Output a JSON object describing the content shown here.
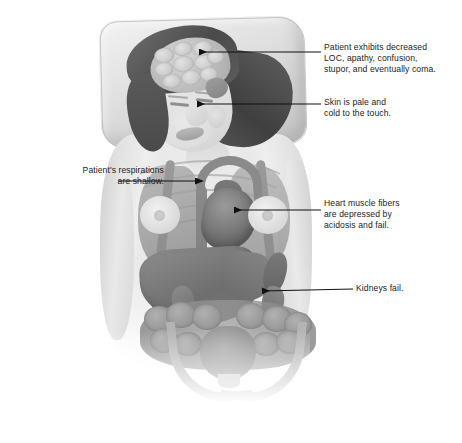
{
  "figure": {
    "palette": {
      "background": "#ffffff",
      "skin": "#e4e4e4",
      "pillow": "#dedede",
      "hair": "#4a4a4a",
      "organ_dark": "#6e6e6e",
      "organ_mid": "#8d8d8d",
      "vessel": "#8a8a8a",
      "leader_line": "#111111",
      "text": "#1b1b1b"
    }
  },
  "annotations": [
    {
      "id": "brain",
      "name": "loc-annotation",
      "text": "Patient exhibits decreased\nLOC, apathy, confusion,\nstupor, and eventually coma.",
      "target": "brain",
      "arrow": true,
      "direction": "left"
    },
    {
      "id": "skin",
      "name": "skin-annotation",
      "text": "Skin is pale and\ncold to the touch.",
      "target": "face-skin",
      "arrow": true,
      "direction": "left"
    },
    {
      "id": "respirations",
      "name": "respirations-annotation",
      "text": "Patient's respirations\nare shallow.",
      "target": "lung",
      "arrow": true,
      "direction": "right"
    },
    {
      "id": "heart",
      "name": "heart-annotation",
      "text": "Heart muscle fibers\nare depressed by\nacidosis and fail.",
      "target": "heart",
      "arrow": true,
      "direction": "left"
    },
    {
      "id": "kidneys",
      "name": "kidneys-annotation",
      "text": "Kidneys fail.",
      "target": "kidney",
      "arrow": true,
      "direction": "left"
    }
  ],
  "anatomy": [
    {
      "name": "pillow",
      "label": "pillow"
    },
    {
      "name": "brain",
      "label": "brain"
    },
    {
      "name": "face",
      "label": "face"
    },
    {
      "name": "lung-left",
      "label": "left lung"
    },
    {
      "name": "lung-right",
      "label": "right lung"
    },
    {
      "name": "heart",
      "label": "heart"
    },
    {
      "name": "aorta",
      "label": "aorta"
    },
    {
      "name": "liver",
      "label": "liver"
    },
    {
      "name": "spleen",
      "label": "spleen"
    },
    {
      "name": "kidney-left",
      "label": "left kidney"
    },
    {
      "name": "kidney-right",
      "label": "right kidney"
    },
    {
      "name": "intestines",
      "label": "intestines"
    },
    {
      "name": "bladder",
      "label": "bladder"
    },
    {
      "name": "pelvis",
      "label": "pelvis"
    }
  ]
}
